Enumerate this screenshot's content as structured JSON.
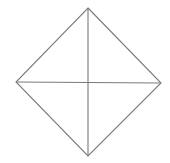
{
  "figure": {
    "shape": "square rotated 45 degrees (diamond) with both diagonals",
    "stroke_color": "#7a7a7a",
    "background": "#ffffff",
    "stroke_width": 1.1,
    "vertices": {
      "top": [
        88,
        8
      ],
      "right": [
        161,
        83
      ],
      "bottom": [
        88,
        156
      ],
      "left": [
        16,
        82
      ]
    },
    "center": [
      88,
      82
    ]
  }
}
